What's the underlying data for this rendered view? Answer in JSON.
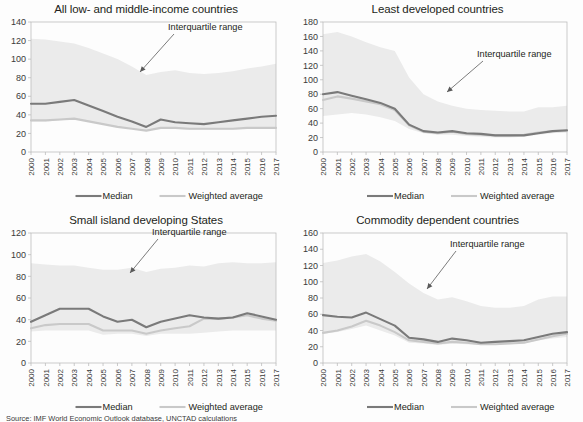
{
  "figure": {
    "source_note": "Source: IMF World Economic Outlook database, UNCTAD calculations",
    "annotation_label": "Interquartile range",
    "legend": {
      "median_label": "Median",
      "weighted_average_label": "Weighted average",
      "median_color": "#7a7a7a",
      "weighted_average_color": "#c9c9c9",
      "band_color": "#ebebeb"
    }
  },
  "chart_data": [
    {
      "type": "area",
      "panel": "top-left",
      "title": "All low- and middle-income countries",
      "xlabel": "",
      "ylabel": "",
      "ylim": [
        0,
        140
      ],
      "ytick_step": 20,
      "yticks": [
        0,
        20,
        40,
        60,
        80,
        100,
        120,
        140
      ],
      "grid": false,
      "legend_position": "bottom",
      "annotations": [
        {
          "text": "Interquartile range",
          "points_to": "band"
        }
      ],
      "categories": [
        2000,
        2001,
        2002,
        2003,
        2004,
        2005,
        2006,
        2007,
        2008,
        2009,
        2010,
        2011,
        2012,
        2013,
        2014,
        2015,
        2016,
        2017
      ],
      "series": [
        {
          "name": "Interquartile range upper",
          "values": [
            122,
            121,
            119,
            117,
            112,
            106,
            100,
            92,
            83,
            86,
            88,
            85,
            84,
            85,
            87,
            90,
            92,
            95
          ]
        },
        {
          "name": "Interquartile range lower",
          "values": [
            33,
            33,
            34,
            36,
            33,
            30,
            27,
            25,
            23,
            25,
            25,
            24,
            24,
            24,
            24,
            25,
            25,
            26
          ]
        },
        {
          "name": "Median",
          "values": [
            52,
            52,
            54,
            56,
            50,
            44,
            38,
            33,
            27,
            35,
            32,
            31,
            30,
            32,
            34,
            36,
            38,
            39
          ]
        },
        {
          "name": "Weighted average",
          "values": [
            34,
            34,
            35,
            36,
            33,
            30,
            27,
            25,
            23,
            26,
            26,
            25,
            25,
            25,
            25,
            26,
            26,
            26
          ]
        }
      ]
    },
    {
      "type": "area",
      "panel": "top-right",
      "title": "Least developed countries",
      "xlabel": "",
      "ylabel": "",
      "ylim": [
        0,
        180
      ],
      "ytick_step": 20,
      "yticks": [
        0,
        20,
        40,
        60,
        80,
        100,
        120,
        140,
        160,
        180
      ],
      "grid": false,
      "legend_position": "bottom",
      "annotations": [
        {
          "text": "Interquartile range",
          "points_to": "band"
        }
      ],
      "categories": [
        2000,
        2001,
        2002,
        2003,
        2004,
        2005,
        2006,
        2007,
        2008,
        2009,
        2010,
        2011,
        2012,
        2013,
        2014,
        2015,
        2016,
        2017
      ],
      "series": [
        {
          "name": "Interquartile range upper",
          "values": [
            163,
            166,
            160,
            152,
            145,
            140,
            103,
            80,
            70,
            64,
            60,
            58,
            57,
            56,
            56,
            62,
            62,
            64
          ]
        },
        {
          "name": "Interquartile range lower",
          "values": [
            50,
            52,
            54,
            52,
            48,
            43,
            32,
            26,
            24,
            24,
            22,
            21,
            20,
            20,
            21,
            24,
            26,
            28
          ]
        },
        {
          "name": "Median",
          "values": [
            80,
            83,
            78,
            73,
            68,
            60,
            38,
            29,
            27,
            29,
            26,
            25,
            23,
            23,
            23,
            26,
            29,
            30
          ]
        },
        {
          "name": "Weighted average",
          "values": [
            72,
            77,
            74,
            70,
            66,
            58,
            37,
            28,
            26,
            28,
            25,
            24,
            23,
            23,
            24,
            27,
            29,
            29
          ]
        }
      ]
    },
    {
      "type": "area",
      "panel": "bottom-left",
      "title": "Small island developing States",
      "xlabel": "",
      "ylabel": "",
      "ylim": [
        0,
        120
      ],
      "ytick_step": 20,
      "yticks": [
        0,
        20,
        40,
        60,
        80,
        100,
        120
      ],
      "grid": false,
      "legend_position": "bottom",
      "annotations": [
        {
          "text": "Interquartile range",
          "points_to": "band"
        }
      ],
      "categories": [
        2000,
        2001,
        2002,
        2003,
        2004,
        2005,
        2006,
        2007,
        2008,
        2009,
        2010,
        2011,
        2012,
        2013,
        2014,
        2015,
        2016,
        2017
      ],
      "series": [
        {
          "name": "Interquartile range upper",
          "values": [
            92,
            91,
            90,
            90,
            88,
            86,
            86,
            88,
            84,
            87,
            88,
            90,
            89,
            92,
            93,
            92,
            92,
            93
          ]
        },
        {
          "name": "Interquartile range lower",
          "values": [
            29,
            30,
            30,
            30,
            30,
            26,
            27,
            27,
            25,
            27,
            27,
            27,
            28,
            29,
            30,
            30,
            30,
            30
          ]
        },
        {
          "name": "Median",
          "values": [
            38,
            44,
            50,
            50,
            50,
            43,
            38,
            40,
            33,
            38,
            41,
            44,
            42,
            41,
            42,
            46,
            43,
            40
          ]
        },
        {
          "name": "Weighted average",
          "values": [
            32,
            35,
            36,
            36,
            36,
            30,
            30,
            30,
            27,
            30,
            32,
            34,
            41,
            41,
            42,
            44,
            41,
            39
          ]
        }
      ]
    },
    {
      "type": "area",
      "panel": "bottom-right",
      "title": "Commodity dependent countries",
      "xlabel": "",
      "ylabel": "",
      "ylim": [
        0,
        160
      ],
      "ytick_step": 20,
      "yticks": [
        0,
        20,
        40,
        60,
        80,
        100,
        120,
        140,
        160
      ],
      "grid": false,
      "legend_position": "bottom",
      "annotations": [
        {
          "text": "Interquartile range",
          "points_to": "band"
        }
      ],
      "categories": [
        2000,
        2001,
        2002,
        2003,
        2004,
        2005,
        2006,
        2007,
        2008,
        2009,
        2010,
        2011,
        2012,
        2013,
        2014,
        2015,
        2016,
        2017
      ],
      "series": [
        {
          "name": "Interquartile range upper",
          "values": [
            123,
            126,
            131,
            134,
            125,
            112,
            98,
            86,
            78,
            81,
            76,
            70,
            68,
            68,
            70,
            78,
            82,
            82
          ]
        },
        {
          "name": "Interquartile range lower",
          "values": [
            36,
            38,
            42,
            46,
            40,
            34,
            25,
            24,
            22,
            24,
            23,
            22,
            22,
            23,
            24,
            28,
            30,
            32
          ]
        },
        {
          "name": "Median",
          "values": [
            59,
            57,
            56,
            62,
            54,
            46,
            31,
            29,
            26,
            30,
            28,
            25,
            26,
            27,
            28,
            32,
            36,
            38
          ]
        },
        {
          "name": "Weighted average",
          "values": [
            37,
            40,
            45,
            52,
            46,
            38,
            28,
            26,
            24,
            26,
            25,
            23,
            23,
            24,
            25,
            29,
            33,
            36
          ]
        }
      ]
    }
  ]
}
